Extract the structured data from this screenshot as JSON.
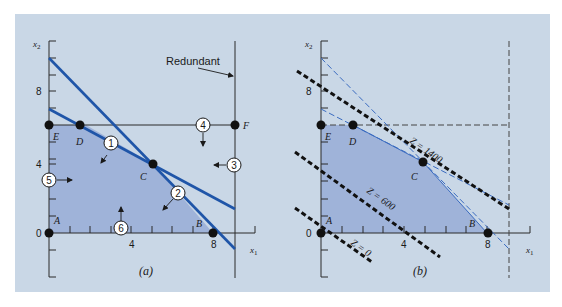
{
  "figure": {
    "background_color": "#c9d7e6",
    "feasible_fill": "#9fb3d9",
    "constraint_line_color": "#1f55a8",
    "panels": [
      {
        "id": "a",
        "caption": "(a)",
        "x_axis_label": "x1",
        "y_axis_label": "x2",
        "x_ticks": [
          "4",
          "8"
        ],
        "y_ticks": [
          "0",
          "4",
          "8"
        ],
        "annotation": "Redundant",
        "vertices": [
          {
            "name": "A",
            "x": 0,
            "y": 0
          },
          {
            "name": "B",
            "x": 8,
            "y": 0
          },
          {
            "name": "C",
            "x": 4.9,
            "y": 3.9
          },
          {
            "name": "D",
            "x": 1.8,
            "y": 6
          },
          {
            "name": "E",
            "x": 0,
            "y": 6
          },
          {
            "name": "F",
            "x": 9,
            "y": 6
          }
        ],
        "constraints": [
          "1",
          "2",
          "3",
          "4",
          "5",
          "6"
        ]
      },
      {
        "id": "b",
        "caption": "(b)",
        "x_axis_label": "x1",
        "y_axis_label": "x2",
        "x_ticks": [
          "4",
          "8"
        ],
        "y_ticks": [
          "0",
          "8"
        ],
        "vertices": [
          {
            "name": "A",
            "x": 0,
            "y": 0
          },
          {
            "name": "B",
            "x": 8,
            "y": 0
          },
          {
            "name": "C",
            "x": 4.9,
            "y": 3.9
          },
          {
            "name": "D",
            "x": 1.8,
            "y": 6
          },
          {
            "name": "E",
            "x": 0,
            "y": 6
          }
        ],
        "objective_lines": [
          {
            "label": "Z = 0"
          },
          {
            "label": "Z = 600"
          },
          {
            "label": "Z = 1400"
          }
        ]
      }
    ]
  },
  "labels": {
    "a": {
      "caption": "(a)",
      "x1": "x",
      "x1_sub": "1",
      "x2": "x",
      "x2_sub": "2",
      "tick_x4": "4",
      "tick_x8": "8",
      "tick_y0": "0",
      "tick_y4": "4",
      "tick_y8": "8",
      "redundant": "Redundant",
      "A": "A",
      "B": "B",
      "C": "C",
      "D": "D",
      "E": "E",
      "F": "F",
      "c1": "1",
      "c2": "2",
      "c3": "3",
      "c4": "4",
      "c5": "5",
      "c6": "6"
    },
    "b": {
      "caption": "(b)",
      "x1": "x",
      "x1_sub": "1",
      "x2": "x",
      "x2_sub": "2",
      "tick_x4": "4",
      "tick_x8": "8",
      "tick_y0": "0",
      "tick_y8": "8",
      "A": "A",
      "B": "B",
      "C": "C",
      "D": "D",
      "E": "E",
      "z0": "Z = 0",
      "z600": "Z = 600",
      "z1400": "Z = 1400"
    }
  }
}
